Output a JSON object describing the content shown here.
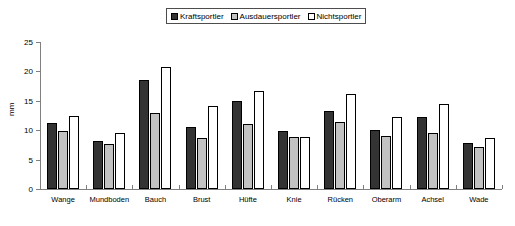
{
  "chart_data": {
    "type": "bar",
    "title": "",
    "xlabel": "",
    "ylabel": "mm",
    "ylim": [
      0,
      25
    ],
    "yticks": [
      0,
      5,
      10,
      15,
      20,
      25
    ],
    "grid": false,
    "legend_position": "top-center",
    "categories": [
      "Wange",
      "Mundboden",
      "Bauch",
      "Brust",
      "Hüfte",
      "Knie",
      "Rücken",
      "Oberarm",
      "Achsel",
      "Wade"
    ],
    "series": [
      {
        "name": "Kraftsportler",
        "color": "#333333",
        "values": [
          11.3,
          8.1,
          18.5,
          10.6,
          14.9,
          9.9,
          13.3,
          10.0,
          12.2,
          7.8
        ]
      },
      {
        "name": "Ausdauersportler",
        "color": "#c2c2c2",
        "values": [
          9.9,
          7.6,
          13.0,
          8.7,
          11.0,
          8.8,
          11.4,
          9.1,
          9.5,
          7.1
        ]
      },
      {
        "name": "Nichtsportler",
        "color": "#ffffff",
        "values": [
          12.4,
          9.5,
          20.8,
          14.2,
          16.7,
          8.9,
          16.2,
          12.3,
          14.5,
          8.7
        ]
      }
    ]
  }
}
